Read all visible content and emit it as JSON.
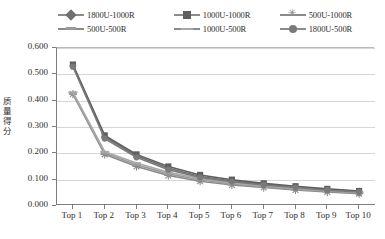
{
  "chart_data": {
    "type": "line",
    "title": "",
    "xlabel": "",
    "ylabel": "质量得分",
    "categories": [
      "Top 1",
      "Top 2",
      "Top 3",
      "Top 4",
      "Top 5",
      "Top 6",
      "Top 7",
      "Top 8",
      "Top 9",
      "Top 10"
    ],
    "ylim": [
      0.0,
      0.6
    ],
    "ytick_labels": [
      "0.600",
      "0.500",
      "0.400",
      "0.300",
      "0.200",
      "0.100",
      "0.000"
    ],
    "ytick_values": [
      0.6,
      0.5,
      0.4,
      0.3,
      0.2,
      0.1,
      0.0
    ],
    "grid": true,
    "legend_position": "top",
    "series": [
      {
        "name": "1800U-1000R",
        "marker": "diamond",
        "color": "#6f6f6f",
        "values": [
          0.533,
          0.262,
          0.191,
          0.143,
          0.112,
          0.095,
          0.083,
          0.072,
          0.062,
          0.055
        ]
      },
      {
        "name": "1000U-1000R",
        "marker": "square",
        "color": "#5f5f5f",
        "values": [
          0.537,
          0.268,
          0.196,
          0.15,
          0.118,
          0.1,
          0.086,
          0.075,
          0.065,
          0.057
        ]
      },
      {
        "name": "500U-1000R",
        "marker": "star",
        "color": "#8a8a8a",
        "values": [
          0.425,
          0.196,
          0.15,
          0.116,
          0.094,
          0.08,
          0.07,
          0.061,
          0.053,
          0.047
        ]
      },
      {
        "name": "500U-500R",
        "marker": "dash",
        "color": "#9a9a9a",
        "values": [
          0.428,
          0.201,
          0.157,
          0.122,
          0.099,
          0.084,
          0.073,
          0.064,
          0.056,
          0.049
        ]
      },
      {
        "name": "1000U-500R",
        "marker": "line",
        "color": "#a8a8a8",
        "values": [
          0.432,
          0.206,
          0.163,
          0.128,
          0.104,
          0.088,
          0.077,
          0.067,
          0.058,
          0.051
        ]
      },
      {
        "name": "1800U-500R",
        "marker": "circle",
        "color": "#7a7a7a",
        "values": [
          0.529,
          0.256,
          0.185,
          0.138,
          0.108,
          0.092,
          0.08,
          0.07,
          0.06,
          0.053
        ]
      }
    ]
  },
  "legend": {
    "rows": [
      [
        {
          "label": "1800U-1000R",
          "marker": "diamond"
        },
        {
          "label": "1000U-1000R",
          "marker": "square"
        },
        {
          "label": "500U-1000R",
          "marker": "star"
        }
      ],
      [
        {
          "label": "500U-500R",
          "marker": "dash"
        },
        {
          "label": "1000U-500R",
          "marker": "line"
        },
        {
          "label": "1800U-500R",
          "marker": "circle"
        }
      ]
    ]
  },
  "axes": {
    "y_title_chars": [
      "质",
      "量",
      "得",
      "分"
    ]
  }
}
